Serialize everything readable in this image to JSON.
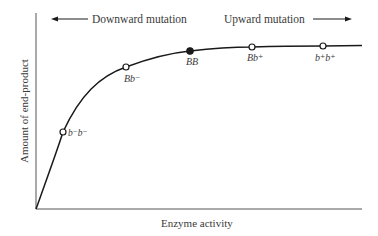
{
  "diagram": {
    "top_arrows": {
      "left_label": "Downward mutation",
      "right_label": "Upward mutation"
    },
    "axes": {
      "xlabel": "Enzyme activity",
      "ylabel": "Amount of end-product"
    },
    "points": [
      {
        "genotype": "b⁻b⁻",
        "filled": false
      },
      {
        "genotype": "Bb⁻",
        "filled": false
      },
      {
        "genotype": "BB",
        "filled": true
      },
      {
        "genotype": "Bb⁺",
        "filled": false
      },
      {
        "genotype": "b⁺b⁺",
        "filled": false
      }
    ],
    "colors": {
      "line": "#1a1a1a",
      "text": "#3a3a3a",
      "axis": "#555555"
    }
  }
}
